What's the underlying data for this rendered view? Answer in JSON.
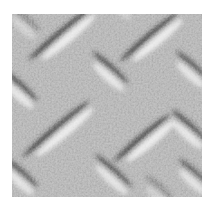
{
  "image": {
    "description": "Grayscale close-up photograph of diamond plate (checker plate) metal texture with raised diagonal oval lugs and halftone grain",
    "canvas": {
      "width": 209,
      "height": 215,
      "margin_color": "#ffffff"
    },
    "plate": {
      "x": 12,
      "y": 14,
      "width": 190,
      "height": 183,
      "base_color": "#a8a8a8",
      "highlight_color": "#eeeeee",
      "shadow_color": "#3c3c3c",
      "grain_opacity": 0.45
    },
    "lugs": [
      {
        "cx": 64,
        "cy": 36,
        "angle": -40,
        "length": 82,
        "strength": 1.0
      },
      {
        "cx": 153,
        "cy": 39,
        "angle": -40,
        "length": 76,
        "strength": 1.0
      },
      {
        "cx": 60,
        "cy": 131,
        "angle": -40,
        "length": 88,
        "strength": 1.0
      },
      {
        "cx": 146,
        "cy": 140,
        "angle": -40,
        "length": 74,
        "strength": 1.0
      },
      {
        "cx": 109,
        "cy": 72,
        "angle": 42,
        "length": 48,
        "strength": 0.9
      },
      {
        "cx": 19,
        "cy": 90,
        "angle": 42,
        "length": 46,
        "strength": 0.9
      },
      {
        "cx": 191,
        "cy": 70,
        "angle": 42,
        "length": 44,
        "strength": 0.85
      },
      {
        "cx": 188,
        "cy": 130,
        "angle": 42,
        "length": 48,
        "strength": 0.9
      },
      {
        "cx": 20,
        "cy": 177,
        "angle": 42,
        "length": 44,
        "strength": 0.85
      },
      {
        "cx": 112,
        "cy": 175,
        "angle": 42,
        "length": 50,
        "strength": 0.85
      },
      {
        "cx": 193,
        "cy": 177,
        "angle": 42,
        "length": 42,
        "strength": 0.8
      },
      {
        "cx": 24,
        "cy": 23,
        "angle": 42,
        "length": 38,
        "strength": 0.5
      },
      {
        "cx": 120,
        "cy": 4,
        "angle": 42,
        "length": 36,
        "strength": 0.45
      },
      {
        "cx": 158,
        "cy": 192,
        "angle": 42,
        "length": 36,
        "strength": 0.45
      }
    ]
  }
}
